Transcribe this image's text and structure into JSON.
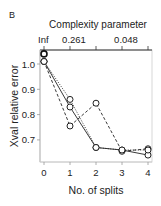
{
  "panel_label": "B",
  "chart_data": {
    "type": "line",
    "title": "",
    "xlabel": "No. of splits",
    "ylabel": "Xval relative error",
    "top_axis_label": "Complexity parameter",
    "top_tick_labels": [
      {
        "x": 0,
        "label": "Inf"
      },
      {
        "x": 1,
        "label": "0.261"
      },
      {
        "x": 3,
        "label": "0.048"
      }
    ],
    "x": [
      0,
      1,
      2,
      3,
      4
    ],
    "x_tick_labels": [
      "0",
      "1",
      "2",
      "3",
      "4"
    ],
    "y_ticks": [
      0.7,
      0.8,
      0.9,
      1.0
    ],
    "y_tick_labels": [
      "0.7",
      "0.8",
      "0.9",
      "1.0"
    ],
    "xlim": [
      -0.05,
      4.15
    ],
    "ylim": [
      0.62,
      1.05
    ],
    "grid": false,
    "series": [
      {
        "name": "solid",
        "style": "solid",
        "values": [
          1.01,
          0.83,
          0.67,
          0.66,
          0.64
        ]
      },
      {
        "name": "dashed",
        "style": "dashed",
        "values": [
          1.01,
          0.755,
          0.845,
          0.655,
          0.665
        ]
      },
      {
        "name": "dotted",
        "style": "dotted",
        "values": [
          1.01,
          0.86,
          0.67,
          0.66,
          0.66
        ]
      }
    ],
    "extra_points": [
      {
        "x": 0,
        "y": 1.04
      }
    ]
  }
}
